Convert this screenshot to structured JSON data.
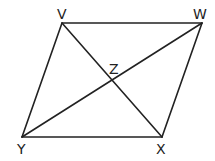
{
  "diagram": {
    "type": "parallelogram",
    "stroke_color": "#222222",
    "background": "#ffffff",
    "vertices": {
      "V": {
        "label": "V",
        "x": 62,
        "y": 23
      },
      "W": {
        "label": "W",
        "x": 202,
        "y": 23
      },
      "X": {
        "label": "X",
        "x": 162,
        "y": 137
      },
      "Y": {
        "label": "Y",
        "x": 22,
        "y": 137
      }
    },
    "intersection": {
      "label": "Z",
      "x": 112,
      "y": 80
    },
    "segments": [
      "VW",
      "WX",
      "XY",
      "YV",
      "VX",
      "YW"
    ]
  }
}
